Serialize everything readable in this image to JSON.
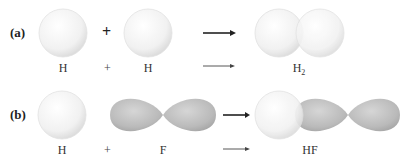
{
  "figure": {
    "panels": [
      {
        "label": "(a)",
        "reactants": [
          {
            "symbol": "H",
            "orbital": "s"
          },
          {
            "symbol": "H",
            "orbital": "s"
          }
        ],
        "operator": "+",
        "product": {
          "formula": "H",
          "subscript": "2",
          "orbital": "s-s overlap"
        }
      },
      {
        "label": "(b)",
        "reactants": [
          {
            "symbol": "H",
            "orbital": "s"
          },
          {
            "symbol": "F",
            "orbital": "p"
          }
        ],
        "operator": "+",
        "product": {
          "formula": "HF",
          "subscript": "",
          "orbital": "s-p overlap"
        }
      }
    ],
    "colors": {
      "s_orbital": "#f4f4f4",
      "p_orbital": "#bdbdbd",
      "arrow": "#222222",
      "background": "#ffffff"
    }
  }
}
